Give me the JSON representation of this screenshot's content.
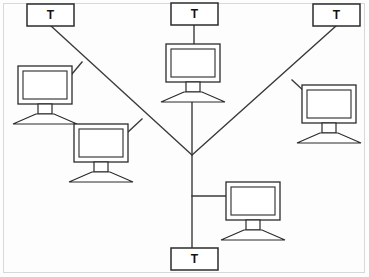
{
  "diagram": {
    "type": "tree-network-topology",
    "canvas": {
      "width": 369,
      "height": 277,
      "background": "#fdfdfd"
    },
    "colors": {
      "line": "#3a3a3a",
      "node_stroke": "#2b2b2b",
      "node_fill": "#ffffff",
      "frame": "#d8d8d8",
      "label": "#111111"
    },
    "frame": {
      "x": 3,
      "y": 3,
      "width": 362,
      "height": 270
    },
    "junction": {
      "name": "central-junction",
      "x": 192,
      "y": 155
    },
    "terminals": [
      {
        "id": "terminal-top-left",
        "label": "T",
        "x": 27,
        "y": 4,
        "width": 47,
        "height": 22,
        "cx": 50.5,
        "cy": 15
      },
      {
        "id": "terminal-top-center",
        "label": "T",
        "x": 171,
        "y": 3,
        "width": 47,
        "height": 22,
        "cx": 194.5,
        "cy": 14
      },
      {
        "id": "terminal-top-right",
        "label": "T",
        "x": 313,
        "y": 4,
        "width": 47,
        "height": 22,
        "cx": 336.5,
        "cy": 15
      },
      {
        "id": "terminal-bottom",
        "label": "T",
        "x": 171,
        "y": 248,
        "width": 47,
        "height": 22,
        "cx": 194.5,
        "cy": 259
      }
    ],
    "computers": [
      {
        "id": "computer-left-upper",
        "x": 18,
        "y": 66,
        "scale": 1.0
      },
      {
        "id": "computer-left-lower",
        "x": 74,
        "y": 124,
        "scale": 1.0
      },
      {
        "id": "computer-center-top",
        "x": 166,
        "y": 44,
        "scale": 1.0
      },
      {
        "id": "computer-right",
        "x": 302,
        "y": 85,
        "scale": 1.0
      },
      {
        "id": "computer-bottom-right",
        "x": 226,
        "y": 182,
        "scale": 1.0
      }
    ],
    "links": [
      {
        "id": "link-trunk-vertical",
        "from": "computer-center-top",
        "to": "terminal-bottom",
        "path": "M 192 80 L 192 248"
      },
      {
        "id": "link-center-terminal",
        "from": "terminal-top-center",
        "to": "computer-center-top",
        "path": "M 194 25 L 194 44"
      },
      {
        "id": "link-branch-left",
        "from": "terminal-top-left",
        "to": "central-junction",
        "path": "M 51 26 L 192 155"
      },
      {
        "id": "link-branch-right",
        "from": "terminal-top-right",
        "to": "central-junction",
        "path": "M 336 26 L 192 155"
      },
      {
        "id": "link-stub-left-upper",
        "from": "computer-left-upper",
        "to": "link-branch-left",
        "path": "M 72 74 L 82 62"
      },
      {
        "id": "link-stub-left-lower",
        "from": "computer-left-lower",
        "to": "link-branch-left",
        "path": "M 128 132 L 142 119"
      },
      {
        "id": "link-stub-right",
        "from": "computer-right",
        "to": "link-branch-right",
        "path": "M 305 92 L 292 80"
      },
      {
        "id": "link-stub-bottom-right",
        "from": "computer-bottom-right",
        "to": "link-trunk-vertical",
        "path": "M 192 196 L 230 196"
      }
    ],
    "computer_glyph": {
      "monitor_outer": {
        "width": 54,
        "height": 38,
        "rx": 0
      },
      "monitor_screen": {
        "inset_x": 5,
        "inset_y": 5
      },
      "neck": {
        "width": 14,
        "height": 10
      },
      "base": {
        "half_width": 32,
        "height": 10
      }
    }
  }
}
